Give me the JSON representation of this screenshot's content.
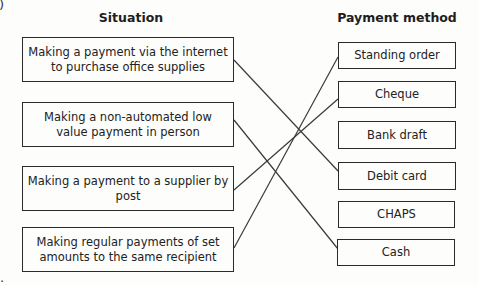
{
  "diagram": {
    "headings": {
      "left": "Situation",
      "right": "Payment method"
    },
    "situations": [
      {
        "label": "Making a payment via the internet to purchase office supplies"
      },
      {
        "label": "Making a non-automated low value payment in person"
      },
      {
        "label": "Making a payment to a supplier by post"
      },
      {
        "label": "Making regular payments of set amounts to the same recipient"
      }
    ],
    "payment_methods": [
      {
        "label": "Standing order"
      },
      {
        "label": "Cheque"
      },
      {
        "label": "Bank draft"
      },
      {
        "label": "Debit card"
      },
      {
        "label": "CHAPS"
      },
      {
        "label": "Cash"
      }
    ],
    "connections": [
      {
        "from": "Making a payment via the internet to purchase office supplies",
        "to": "Debit card"
      },
      {
        "from": "Making a non-automated low value payment in person",
        "to": "Cash"
      },
      {
        "from": "Making a payment to a supplier by post",
        "to": "Cheque"
      },
      {
        "from": "Making regular payments of set amounts to the same recipient",
        "to": "Standing order"
      }
    ],
    "corner_marks": {
      "top_left": ")",
      "bottom_left": "."
    },
    "line_color": "#3a3a3a"
  }
}
